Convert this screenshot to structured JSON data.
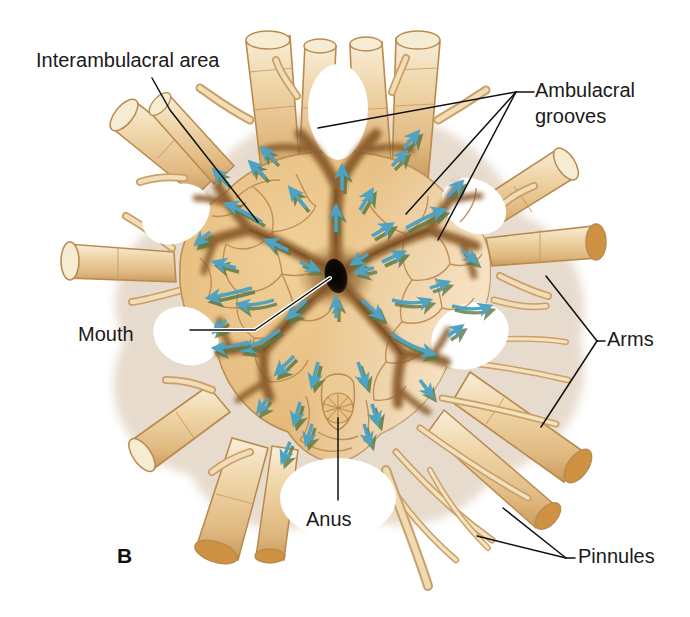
{
  "figure": {
    "panel_letter": "B",
    "background_color": "#ffffff"
  },
  "labels": [
    {
      "id": "interambulacral",
      "text": "Interambulacral area",
      "x": 36,
      "y": 62,
      "anchor": "start"
    },
    {
      "id": "ambulacral",
      "text": "Ambulacral",
      "x": 535,
      "y": 92,
      "anchor": "start"
    },
    {
      "id": "ambulacral2",
      "text": "grooves",
      "x": 535,
      "y": 118,
      "anchor": "start"
    },
    {
      "id": "mouth",
      "text": "Mouth",
      "x": 78,
      "y": 336,
      "anchor": "start"
    },
    {
      "id": "arms",
      "text": "Arms",
      "x": 607,
      "y": 341,
      "anchor": "start"
    },
    {
      "id": "anus",
      "text": "Anus",
      "x": 306,
      "y": 521,
      "anchor": "start"
    },
    {
      "id": "pinnules",
      "text": "Pinnules",
      "x": 578,
      "y": 558,
      "anchor": "start"
    }
  ],
  "colors": {
    "plate_light": "#f4e3c2",
    "plate_mid": "#e8bf80",
    "plate_deep": "#d9a45c",
    "groove_dark": "#9b6b33",
    "groove_shadow": "#7d5324",
    "arm_fill": "#eccd9c",
    "arm_light": "#f7ecd6",
    "arm_outline": "#b98a4e",
    "cut_end": "#cf9242",
    "cut_end_pale": "#f6ecd2",
    "arrow_blue": "#4ea2c4",
    "arrow_shadow": "#5d7a46",
    "mouth_black": "#120d08",
    "label_text": "#1a1a1a"
  },
  "anatomy": {
    "mouth": {
      "cx": 336,
      "cy": 276,
      "rx": 11,
      "ry": 17,
      "name": "mouth"
    },
    "anus": {
      "cx": 338,
      "cy": 409,
      "r": 20,
      "name": "anal-papilla"
    },
    "ambulacral_groove_count": 5,
    "arm_count": 10,
    "arrow_count": 44,
    "arrow_meaning": "direction of ciliary food-current flow toward the mouth"
  },
  "leaders": {
    "interambulacral": "M 152 78 L 170 110 L 258 222",
    "mouth_white": "M 190 330 L 255 330 L 330 278",
    "mouth": "M 190 330 L 255 330 L 330 278",
    "ambulacral_hub": {
      "x": 516,
      "y": 92
    },
    "ambulacral_targets": [
      {
        "x": 318,
        "y": 128
      },
      {
        "x": 406,
        "y": 214
      },
      {
        "x": 438,
        "y": 240
      }
    ],
    "arms_hub": {
      "x": 597,
      "y": 341
    },
    "arms_targets": [
      {
        "x": 546,
        "y": 276
      },
      {
        "x": 541,
        "y": 427
      }
    ],
    "anus": "M 338 500 L 338 418",
    "pinnules_hub": {
      "x": 566,
      "y": 558
    },
    "pinnules_targets": [
      {
        "x": 503,
        "y": 508
      },
      {
        "x": 477,
        "y": 536
      }
    ]
  }
}
